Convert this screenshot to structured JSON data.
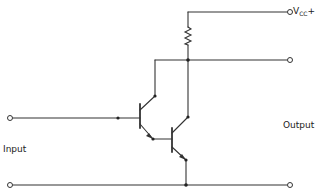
{
  "diagram": {
    "labels": {
      "vcc_main": "V",
      "vcc_sub": "CC",
      "vcc_sign": "+",
      "input": "Input",
      "output": "Output"
    },
    "components": [
      {
        "type": "resistor",
        "id": "R1",
        "position": "collector load to Vcc"
      },
      {
        "type": "npn-transistor",
        "id": "Q1",
        "role": "input transistor"
      },
      {
        "type": "npn-transistor",
        "id": "Q2",
        "role": "output transistor"
      }
    ],
    "terminals": [
      {
        "id": "vcc",
        "label": "Vcc+"
      },
      {
        "id": "output-top",
        "label": ""
      },
      {
        "id": "output-bottom",
        "label": ""
      },
      {
        "id": "input-top",
        "label": ""
      },
      {
        "id": "input-bottom",
        "label": ""
      }
    ],
    "colors": {
      "wire": "#333333",
      "text": "#222222",
      "background": "#ffffff"
    }
  }
}
